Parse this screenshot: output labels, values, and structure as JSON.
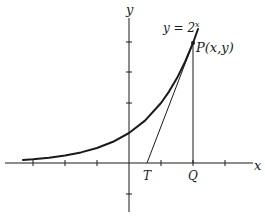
{
  "diagram": {
    "type": "graph",
    "function": "y = 2^x",
    "curve_label": {
      "base": "y = 2",
      "exponent": "x"
    },
    "axes": {
      "x_label": "x",
      "y_label": "y"
    },
    "points": {
      "P": {
        "label": "P(x,y)",
        "x": 2,
        "y": 4
      },
      "T": {
        "label": "T"
      },
      "Q": {
        "label": "Q"
      }
    },
    "x_ticks": [
      -3,
      -2,
      -1,
      1,
      2,
      3
    ],
    "y_ticks": [
      -1,
      2,
      3,
      4
    ],
    "colors": {
      "ink": "#1a1a1a",
      "background": "#ffffff"
    }
  }
}
